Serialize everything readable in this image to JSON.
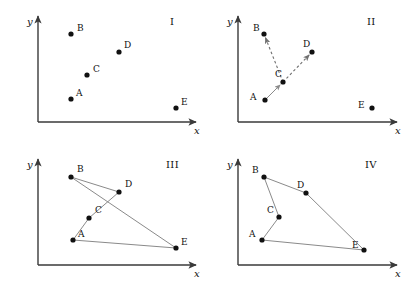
{
  "figure": {
    "width": 409,
    "height": 286,
    "background": "#ffffff",
    "axis_color": "#3a3a3a",
    "line_color": "#8a8a8a",
    "dot_color": "#111111",
    "text_color": "#111111",
    "axis_labels": {
      "x": "x",
      "y": "y"
    }
  },
  "panels": [
    {
      "id": "panel-1",
      "number": "I",
      "origin_x": 0,
      "origin_y": 0,
      "axis": {
        "ox": 38,
        "oy": 122,
        "x_end": 196,
        "y_top": 16
      },
      "points": [
        {
          "name": "A",
          "x": 71,
          "y": 99,
          "lx": 76,
          "ly": 89
        },
        {
          "name": "B",
          "x": 71,
          "y": 34,
          "lx": 77,
          "ly": 24
        },
        {
          "name": "C",
          "x": 87,
          "y": 75,
          "lx": 93,
          "ly": 65
        },
        {
          "name": "D",
          "x": 119,
          "y": 52,
          "lx": 124,
          "ly": 41
        },
        {
          "name": "E",
          "x": 176,
          "y": 108,
          "lx": 181,
          "ly": 98
        }
      ],
      "edges": []
    },
    {
      "id": "panel-2",
      "number": "II",
      "origin_x": 205,
      "origin_y": 0,
      "axis": {
        "ox": 33,
        "oy": 122,
        "x_end": 192,
        "y_top": 16
      },
      "points": [
        {
          "name": "A",
          "x": 60,
          "y": 100,
          "lx": 45,
          "ly": 93
        },
        {
          "name": "B",
          "x": 59,
          "y": 34,
          "lx": 48,
          "ly": 24
        },
        {
          "name": "C",
          "x": 78,
          "y": 82,
          "lx": 70,
          "ly": 70
        },
        {
          "name": "D",
          "x": 107,
          "y": 52,
          "lx": 98,
          "ly": 40
        },
        {
          "name": "E",
          "x": 167,
          "y": 108,
          "lx": 153,
          "ly": 101
        }
      ],
      "edges": [
        {
          "from": "A",
          "to": "C",
          "style": "solid",
          "arrow": true
        },
        {
          "from": "C",
          "to": "B",
          "style": "dashed",
          "arrow": true
        },
        {
          "from": "C",
          "to": "D",
          "style": "dashed",
          "arrow": true
        }
      ]
    },
    {
      "id": "panel-3",
      "number": "III",
      "origin_x": 0,
      "origin_y": 143,
      "axis": {
        "ox": 38,
        "oy": 122,
        "x_end": 196,
        "y_top": 16
      },
      "points": [
        {
          "name": "A",
          "x": 73,
          "y": 97,
          "lx": 78,
          "ly": 87
        },
        {
          "name": "B",
          "x": 71,
          "y": 34,
          "lx": 77,
          "ly": 22
        },
        {
          "name": "C",
          "x": 89,
          "y": 75,
          "lx": 95,
          "ly": 63
        },
        {
          "name": "D",
          "x": 119,
          "y": 49,
          "lx": 125,
          "ly": 37
        },
        {
          "name": "E",
          "x": 176,
          "y": 105,
          "lx": 181,
          "ly": 95
        }
      ],
      "edges": [
        {
          "from": "A",
          "to": "C",
          "style": "solid",
          "arrow": false
        },
        {
          "from": "C",
          "to": "D",
          "style": "solid",
          "arrow": false
        },
        {
          "from": "B",
          "to": "D",
          "style": "solid",
          "arrow": false
        },
        {
          "from": "B",
          "to": "E",
          "style": "solid",
          "arrow": false
        },
        {
          "from": "A",
          "to": "E",
          "style": "solid",
          "arrow": false
        }
      ]
    },
    {
      "id": "panel-4",
      "number": "IV",
      "origin_x": 205,
      "origin_y": 143,
      "axis": {
        "ox": 33,
        "oy": 122,
        "x_end": 192,
        "y_top": 16
      },
      "points": [
        {
          "name": "A",
          "x": 57,
          "y": 97,
          "lx": 44,
          "ly": 87
        },
        {
          "name": "B",
          "x": 59,
          "y": 34,
          "lx": 47,
          "ly": 23
        },
        {
          "name": "C",
          "x": 74,
          "y": 74,
          "lx": 62,
          "ly": 63
        },
        {
          "name": "D",
          "x": 101,
          "y": 50,
          "lx": 92,
          "ly": 38
        },
        {
          "name": "E",
          "x": 159,
          "y": 107,
          "lx": 147,
          "ly": 98
        }
      ],
      "edges": [
        {
          "from": "A",
          "to": "C",
          "style": "solid",
          "arrow": false
        },
        {
          "from": "C",
          "to": "B",
          "style": "solid",
          "arrow": false
        },
        {
          "from": "B",
          "to": "D",
          "style": "solid",
          "arrow": false
        },
        {
          "from": "D",
          "to": "E",
          "style": "solid",
          "arrow": false
        },
        {
          "from": "A",
          "to": "E",
          "style": "solid",
          "arrow": false
        }
      ]
    }
  ],
  "panel_number_positions": [
    {
      "id": "panel-1",
      "lx": 170,
      "ly": 17
    },
    {
      "id": "panel-2",
      "lx": 162,
      "ly": 17
    },
    {
      "id": "panel-3",
      "lx": 166,
      "ly": 17
    },
    {
      "id": "panel-4",
      "lx": 160,
      "ly": 17
    }
  ]
}
